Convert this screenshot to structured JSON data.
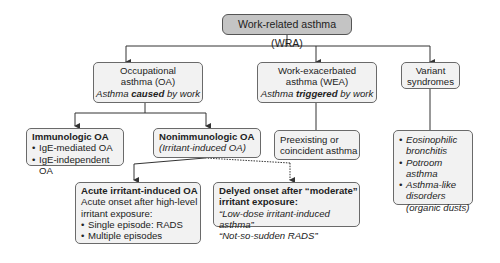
{
  "diagram": {
    "root": {
      "label": "Work-related asthma (WRA)"
    },
    "oa": {
      "line1": "Occupational",
      "line2": "asthma (OA)",
      "caption_pre": "Asthma ",
      "caption_bold": "caused",
      "caption_post": " by work"
    },
    "wea": {
      "line1": "Work-exacerbated",
      "line2": "asthma (WEA)",
      "caption_pre": "Asthma ",
      "caption_bold": "triggered",
      "caption_post": " by work"
    },
    "variant": {
      "line1": "Variant",
      "line2": "syndromes",
      "items": [
        "Eosinophilic bronchitis",
        "Potroom asthma",
        "Asthma-like disorders (organic dusts)"
      ]
    },
    "immunologic": {
      "title": "Immunologic OA",
      "items": [
        "IgE-mediated OA",
        "IgE-independent OA"
      ]
    },
    "nonimmunologic": {
      "title": "Nonimmunologic OA",
      "subtitle": "(Irritant-induced OA)"
    },
    "preexisting": {
      "line1": "Preexisting or",
      "line2": "coincident asthma"
    },
    "acute": {
      "title": "Acute irritant-induced OA",
      "desc1": "Acute onset after high-level",
      "desc2": "irritant exposure:",
      "items": [
        "Single episode: RADS",
        "Multiple episodes"
      ]
    },
    "delayed": {
      "title1": "Delyed onset after “moderate”",
      "title2": "irritant exposure:",
      "quote1": "“Low-dose irritant-induced asthma”",
      "quote2": "“Not-so-sudden RADS”"
    }
  },
  "colors": {
    "root_fill": "#c4c4c4",
    "box_fill": "#f2f2f2",
    "border": "#6a6a6a",
    "connector": "#333333"
  }
}
